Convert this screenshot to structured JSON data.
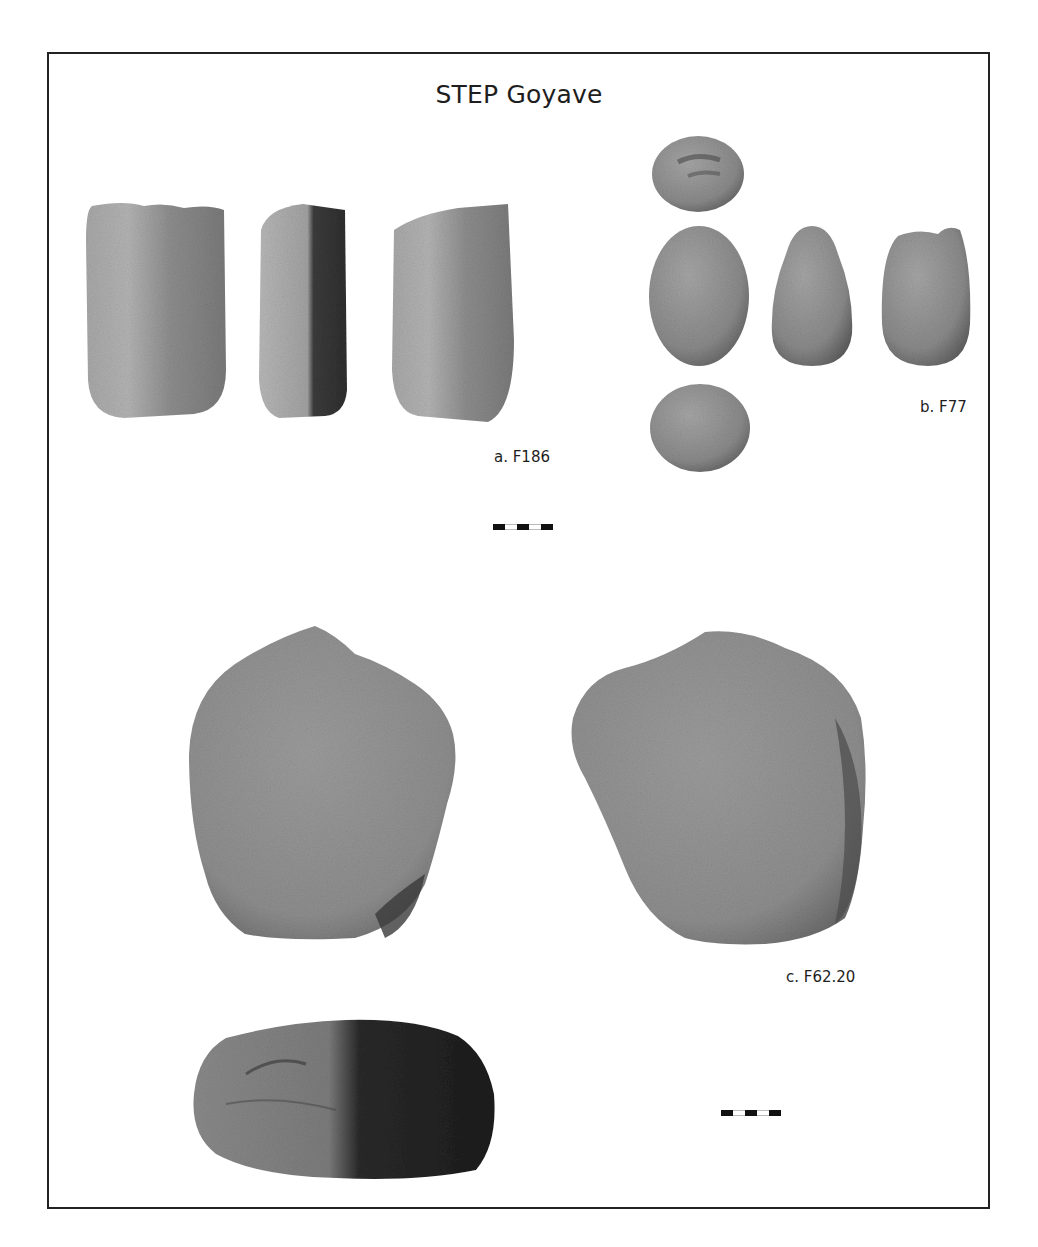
{
  "figure": {
    "title": "STEP Goyave",
    "border_color": "#222222"
  },
  "artifacts": [
    {
      "id": "a",
      "label": "a. F186",
      "views": 3,
      "description": "rectangular stone tool, three views"
    },
    {
      "id": "b",
      "label": "b. F77",
      "views": 5,
      "description": "ovoid pebble, five views"
    },
    {
      "id": "c",
      "label": "c. F62.20",
      "views": 3,
      "description": "large rounded stone, three views"
    }
  ],
  "scale_bars": [
    {
      "name": "scale-bar-upper",
      "segments": [
        "black",
        "white",
        "black",
        "white",
        "black"
      ]
    },
    {
      "name": "scale-bar-lower",
      "segments": [
        "black",
        "white",
        "black",
        "white",
        "black"
      ]
    }
  ],
  "colors": {
    "stone_light": "#a9a9a9",
    "stone_mid": "#8c8c8c",
    "stone_dark": "#4a4a4a",
    "text": "#1e1e1e"
  }
}
